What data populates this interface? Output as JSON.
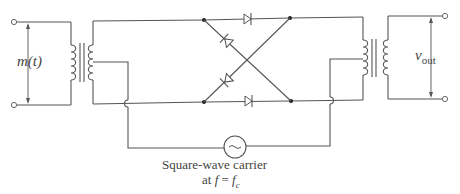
{
  "diagram": {
    "type": "circuit-schematic",
    "labels": {
      "input_signal": "m(t)",
      "output_signal_var": "v",
      "output_signal_sub": "out",
      "carrier_line1": "Square-wave carrier",
      "carrier_line2_prefix": "at ",
      "carrier_line2_f": "f",
      "carrier_line2_eq": " = ",
      "carrier_line2_fc": "f",
      "carrier_line2_sub": "c"
    },
    "components": [
      {
        "id": "input-transformer",
        "kind": "center-tapped transformer"
      },
      {
        "id": "diode-ring",
        "kind": "4-diode ring (2 straight, 2 crossed)"
      },
      {
        "id": "output-transformer",
        "kind": "center-tapped transformer"
      },
      {
        "id": "carrier-source",
        "kind": "AC source",
        "symbol": "~"
      }
    ],
    "colors": {
      "wire": "#555555",
      "text": "#444444",
      "background": "#ffffff"
    }
  }
}
